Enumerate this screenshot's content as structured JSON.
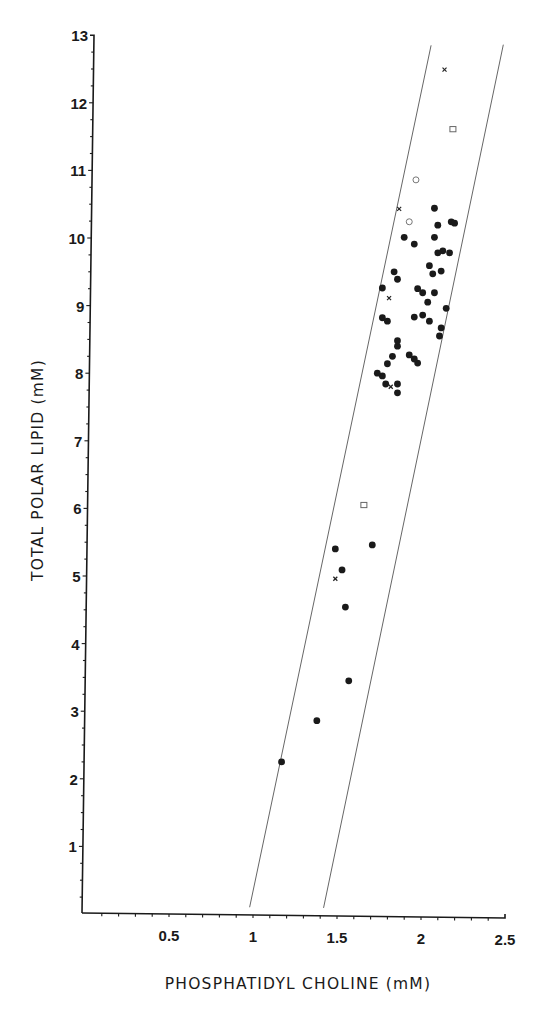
{
  "chart_data": {
    "type": "scatter",
    "title": "",
    "xlabel": "PHOSPHATIDYL CHOLINE (mM)",
    "ylabel": "TOTAL POLAR LIPID (mM)",
    "xlim": [
      0,
      2.5
    ],
    "ylim": [
      0,
      13
    ],
    "grid": false,
    "legend": null,
    "x_ticks": [
      {
        "value": 0.5,
        "label": "0.5"
      },
      {
        "value": 1,
        "label": "1"
      },
      {
        "value": 1.5,
        "label": "1.5"
      },
      {
        "value": 2,
        "label": "2"
      },
      {
        "value": 2.5,
        "label": "2.5"
      }
    ],
    "x_minor_step": 0.1,
    "y_ticks": [
      {
        "value": 1,
        "label": "1"
      },
      {
        "value": 2,
        "label": "2"
      },
      {
        "value": 3,
        "label": "3"
      },
      {
        "value": 4,
        "label": "4"
      },
      {
        "value": 5,
        "label": "5"
      },
      {
        "value": 6,
        "label": "6"
      },
      {
        "value": 7,
        "label": "7"
      },
      {
        "value": 8,
        "label": "8"
      },
      {
        "value": 9,
        "label": "9"
      },
      {
        "value": 10,
        "label": "10"
      },
      {
        "value": 11,
        "label": "11"
      },
      {
        "value": 12,
        "label": "12"
      },
      {
        "value": 13,
        "label": "13"
      }
    ],
    "y_minor_step": 0.25,
    "reference_lines": [
      {
        "name": "lower-bound-line",
        "x": [
          0.98,
          2.06
        ],
        "y": [
          0.1,
          12.85
        ]
      },
      {
        "name": "upper-bound-line",
        "x": [
          1.42,
          2.49
        ],
        "y": [
          0.09,
          12.86
        ]
      }
    ],
    "series": [
      {
        "name": "filled circles",
        "marker": "filled-circle",
        "points": [
          [
            1.17,
            2.25
          ],
          [
            1.38,
            2.86
          ],
          [
            1.57,
            3.45
          ],
          [
            1.55,
            4.54
          ],
          [
            1.53,
            5.09
          ],
          [
            1.49,
            5.4
          ],
          [
            1.71,
            5.46
          ],
          [
            1.86,
            7.71
          ],
          [
            1.86,
            7.84
          ],
          [
            1.79,
            7.84
          ],
          [
            1.77,
            7.96
          ],
          [
            1.74,
            8.0
          ],
          [
            1.8,
            8.14
          ],
          [
            1.98,
            8.15
          ],
          [
            1.96,
            8.21
          ],
          [
            1.93,
            8.27
          ],
          [
            1.83,
            8.25
          ],
          [
            1.86,
            8.4
          ],
          [
            1.86,
            8.48
          ],
          [
            2.11,
            8.55
          ],
          [
            2.12,
            8.67
          ],
          [
            1.8,
            8.77
          ],
          [
            1.77,
            8.82
          ],
          [
            2.05,
            8.77
          ],
          [
            2.01,
            8.86
          ],
          [
            1.96,
            8.83
          ],
          [
            2.15,
            8.96
          ],
          [
            2.04,
            9.05
          ],
          [
            2.08,
            9.19
          ],
          [
            2.01,
            9.19
          ],
          [
            1.98,
            9.25
          ],
          [
            1.77,
            9.26
          ],
          [
            1.86,
            9.39
          ],
          [
            1.84,
            9.5
          ],
          [
            2.07,
            9.47
          ],
          [
            2.05,
            9.59
          ],
          [
            2.12,
            9.51
          ],
          [
            2.17,
            9.78
          ],
          [
            2.13,
            9.81
          ],
          [
            2.1,
            9.78
          ],
          [
            1.96,
            9.91
          ],
          [
            1.9,
            10.01
          ],
          [
            2.08,
            10.01
          ],
          [
            2.1,
            10.19
          ],
          [
            2.18,
            10.24
          ],
          [
            2.2,
            10.22
          ],
          [
            2.08,
            10.44
          ]
        ]
      },
      {
        "name": "crosses",
        "marker": "x",
        "points": [
          [
            1.49,
            4.96
          ],
          [
            1.82,
            7.8
          ],
          [
            1.81,
            9.11
          ],
          [
            1.87,
            10.43
          ],
          [
            2.14,
            12.49
          ]
        ]
      },
      {
        "name": "open circles",
        "marker": "open-circle",
        "points": [
          [
            1.93,
            10.24
          ],
          [
            1.97,
            10.86
          ]
        ]
      },
      {
        "name": "open squares",
        "marker": "open-square",
        "points": [
          [
            1.66,
            6.05
          ],
          [
            2.19,
            11.61
          ]
        ]
      }
    ]
  }
}
